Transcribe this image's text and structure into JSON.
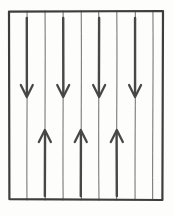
{
  "figure": {
    "title": "Vertical field lines with alternating flow arrows",
    "type": "diagram",
    "style": "hand-drawn-scan",
    "canvas": {
      "width": 173,
      "height": 216
    },
    "background_color": "#fdfdfc",
    "ink_color": "#4a4a4a",
    "frame_color": "#3d3d3d",
    "arrow_color": "#474747"
  },
  "frame": {
    "name": "bounding-rectangle",
    "x": 9,
    "y": 11,
    "width": 154,
    "height": 189,
    "stroke_width": 2.2
  },
  "field_lines": {
    "count": 9,
    "orientation": "vertical",
    "stroke_width": 1.0,
    "x_positions": [
      27,
      45,
      63,
      81,
      99,
      117,
      135,
      153,
      171
    ],
    "top": 11,
    "bottom": 200
  },
  "arrows": {
    "down": {
      "count": 4,
      "label": "downward-arrow",
      "direction": "down",
      "x_positions": [
        27,
        63,
        99,
        135
      ],
      "tail_y": 18,
      "head_y": 97,
      "shaft_width": 2.4,
      "head_half_width": 6,
      "head_length": 12
    },
    "up": {
      "count": 3,
      "label": "upward-arrow",
      "direction": "up",
      "x_positions": [
        45,
        81,
        117
      ],
      "tail_y": 196,
      "head_y": 130,
      "shaft_width": 2.4,
      "head_half_width": 6,
      "head_length": 12
    }
  }
}
